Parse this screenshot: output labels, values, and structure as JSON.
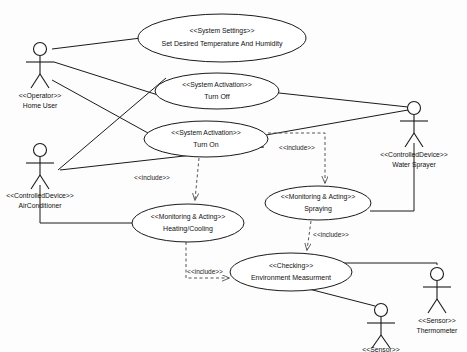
{
  "diagram": {
    "type": "uml-use-case-diagram",
    "background_color": "#fdfdfd",
    "line_color": "#1a1a1a",
    "include_line_color": "#555555"
  },
  "use_cases": [
    {
      "id": "set-temperature-humidity",
      "stereotype": "<<System Settings>>",
      "name": "Set Desired Temperature And Humidity",
      "cx": 222,
      "cy": 38,
      "rx": 84,
      "ry": 24
    },
    {
      "id": "turn-off",
      "stereotype": "<<System Activation>>",
      "name": "Turn Off",
      "cx": 217,
      "cy": 91,
      "rx": 62,
      "ry": 18
    },
    {
      "id": "turn-on",
      "stereotype": "<<System Activation>>",
      "name": "Turn On",
      "cx": 206,
      "cy": 139,
      "rx": 62,
      "ry": 18
    },
    {
      "id": "heating-cooling",
      "stereotype": "<<Monitoring & Acting>>",
      "name": "Heating/Cooling",
      "cx": 188,
      "cy": 223,
      "rx": 56,
      "ry": 19
    },
    {
      "id": "spraying",
      "stereotype": "<<Monitoring & Acting>>",
      "name": "Spraying",
      "cx": 318,
      "cy": 203,
      "rx": 53,
      "ry": 17
    },
    {
      "id": "environment-measurment",
      "stereotype": "<<Checking>>",
      "name": "Environment Measurment",
      "cx": 291,
      "cy": 272,
      "rx": 61,
      "ry": 19
    }
  ],
  "actors": [
    {
      "id": "home-user",
      "stereotype": "<<Operator>>",
      "name": "Home User",
      "x": 40,
      "y": 44
    },
    {
      "id": "air-conditioner",
      "stereotype": "<<ControlledDevice>>",
      "name": "AirConditioner",
      "x": 40,
      "y": 145
    },
    {
      "id": "water-sprayer",
      "stereotype": "<<ControlledDevice>>",
      "name": "Water Sprayer",
      "x": 414,
      "y": 103
    },
    {
      "id": "thermometer",
      "stereotype": "<<Sensor>>",
      "name": "Thermometer",
      "x": 437,
      "y": 269
    },
    {
      "id": "humidity-sensor",
      "stereotype": "<<Sensor>>",
      "name": "",
      "x": 381,
      "y": 305
    }
  ],
  "associations": [
    {
      "id": "home-user-to-settings",
      "from": "home-user",
      "to": "set-temperature-humidity"
    },
    {
      "id": "home-user-to-turn-off",
      "from": "home-user",
      "to": "turn-off"
    },
    {
      "id": "home-user-to-turn-on",
      "from": "home-user",
      "to": "turn-on"
    },
    {
      "id": "air-conditioner-to-turn-off",
      "from": "air-conditioner",
      "to": "turn-off"
    },
    {
      "id": "air-conditioner-to-turn-on",
      "from": "air-conditioner",
      "to": "turn-on"
    },
    {
      "id": "air-conditioner-to-heating-cooling",
      "from": "air-conditioner",
      "to": "heating-cooling"
    },
    {
      "id": "water-sprayer-to-turn-off",
      "from": "water-sprayer",
      "to": "turn-off"
    },
    {
      "id": "water-sprayer-to-turn-on",
      "from": "water-sprayer",
      "to": "turn-on"
    },
    {
      "id": "water-sprayer-to-spraying",
      "from": "water-sprayer",
      "to": "spraying"
    },
    {
      "id": "thermometer-to-environment",
      "from": "thermometer",
      "to": "environment-measurment"
    },
    {
      "id": "humidity-sensor-to-environment",
      "from": "humidity-sensor",
      "to": "environment-measurment"
    }
  ],
  "includes": [
    {
      "id": "turn-on-includes-heating",
      "from": "turn-on",
      "to": "heating-cooling",
      "label": "<<include>>",
      "label_x": 152,
      "label_y": 178
    },
    {
      "id": "turn-on-includes-spraying",
      "from": "turn-on",
      "to": "spraying",
      "label": "<<include>>",
      "label_x": 297,
      "label_y": 148
    },
    {
      "id": "spraying-includes-environment",
      "from": "spraying",
      "to": "environment-measurment",
      "label": "<<include>>",
      "label_x": 327,
      "label_y": 235
    },
    {
      "id": "heating-includes-environment",
      "from": "heating-cooling",
      "to": "environment-measurment",
      "label": "<<include>>",
      "label_x": 202,
      "label_y": 272
    }
  ]
}
